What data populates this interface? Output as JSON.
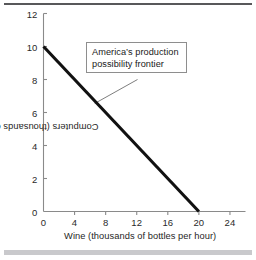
{
  "figure": {
    "name": "production-possibility-frontier-figure",
    "background_color": "#ffffff",
    "top_rule_color": "#58585a",
    "bottom_rule_color": "#c9c9cc"
  },
  "chart_data": {
    "type": "line",
    "title": "",
    "subtitle": "",
    "xlabel": "Wine (thousands of bottles per hour)",
    "ylabel": "Computers (thousands of computers per hour)",
    "xlim": [
      0,
      26
    ],
    "ylim": [
      0,
      12
    ],
    "xticks": [
      0,
      4,
      8,
      12,
      16,
      20,
      24
    ],
    "xtick_labels": [
      "0",
      "4",
      "8",
      "12",
      "16",
      "20",
      "24"
    ],
    "yticks": [
      0,
      2,
      4,
      6,
      8,
      10,
      12
    ],
    "ytick_labels": [
      "0",
      "2",
      "4",
      "6",
      "8",
      "10",
      "12"
    ],
    "grid": false,
    "legend": false,
    "legend_position": "none",
    "series": [
      {
        "name": "America's production possibility frontier",
        "color": "#111111",
        "line_width": 3,
        "x": [
          0,
          20
        ],
        "y": [
          10,
          0
        ],
        "points": [
          {
            "x": 0,
            "y": 10
          },
          {
            "x": 20,
            "y": 0
          }
        ]
      }
    ],
    "annotations": [
      {
        "name": "ppf-callout",
        "lines": [
          "America’s production",
          "possibility frontier"
        ],
        "box": true,
        "box_border_color": "#8e8e8e",
        "leader_from": {
          "x": 12.1,
          "y": 8.0
        },
        "leader_to": {
          "x": 6.6,
          "y": 6.55
        }
      }
    ]
  }
}
